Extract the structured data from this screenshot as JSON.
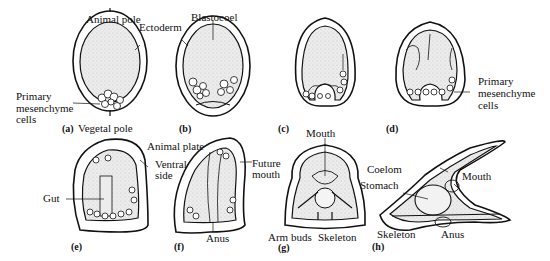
{
  "diagram": {
    "panels": [
      {
        "id": "a",
        "label": "(a)",
        "annotations": [
          "Animal pole",
          "Ectoderm",
          "Primary mesenchyme cells",
          "Vegetal pole"
        ]
      },
      {
        "id": "b",
        "label": "(b)",
        "annotations": [
          "Blastocoel"
        ]
      },
      {
        "id": "c",
        "label": "(c)",
        "annotations": []
      },
      {
        "id": "d",
        "label": "(d)",
        "annotations": [
          "Primary mesenchyme cells"
        ]
      },
      {
        "id": "e",
        "label": "(e)",
        "annotations": [
          "Gut",
          "Ventral side"
        ]
      },
      {
        "id": "f",
        "label": "(f)",
        "annotations": [
          "Animal plate",
          "Future mouth",
          "Anus"
        ]
      },
      {
        "id": "g",
        "label": "(g)",
        "annotations": [
          "Mouth",
          "Arm buds",
          "Skeleton"
        ]
      },
      {
        "id": "h",
        "label": "(h)",
        "annotations": [
          "Coelom",
          "Stomach",
          "Mouth",
          "Skeleton",
          "Anus"
        ]
      }
    ]
  },
  "labels": {
    "animal_pole": "Animal pole",
    "ectoderm": "Ectoderm",
    "blastocoel": "Blastocoel",
    "pmc_a_1": "Primary",
    "pmc_a_2": "mesenchyme",
    "pmc_a_3": "cells",
    "vegetal_pole": "Vegetal pole",
    "pmc_d_1": "Primary",
    "pmc_d_2": "mesenchyme",
    "pmc_d_3": "cells",
    "animal_plate": "Animal plate",
    "ventral_1": "Ventral",
    "ventral_2": "side",
    "gut": "Gut",
    "future_mouth_1": "Future",
    "future_mouth_2": "mouth",
    "anus_f": "Anus",
    "mouth_g": "Mouth",
    "arm_buds": "Arm buds",
    "skeleton_g": "Skeleton",
    "coelom": "Coelom",
    "stomach": "Stomach",
    "mouth_h": "Mouth",
    "skeleton_h": "Skeleton",
    "anus_h": "Anus"
  },
  "panel_labels": {
    "a": "(a)",
    "b": "(b)",
    "c": "(c)",
    "d": "(d)",
    "e": "(e)",
    "f": "(f)",
    "g": "(g)",
    "h": "(h)"
  }
}
